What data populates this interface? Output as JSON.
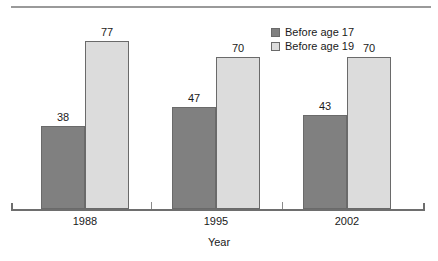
{
  "chart_data": {
    "type": "bar",
    "title": "",
    "subtitle": "",
    "xlabel": "Year",
    "ylabel": "",
    "categories": [
      "1988",
      "1995",
      "2002"
    ],
    "series": [
      {
        "name": "Before age 17",
        "values": [
          38,
          47,
          43
        ],
        "color": "#808080"
      },
      {
        "name": "Before age 19",
        "values": [
          77,
          70,
          70
        ],
        "color": "#dcdcdc"
      }
    ],
    "ylim": [
      0,
      85
    ],
    "grid": false,
    "legend_position": "top-right",
    "value_labels_shown": true,
    "annotations": []
  },
  "legend": {
    "items": [
      {
        "label": "Before age 17",
        "swatch": "dark-gray-swatch"
      },
      {
        "label": "Before age 19",
        "swatch": "light-gray-swatch"
      }
    ]
  },
  "axis": {
    "x_title": "Year",
    "tick_labels": [
      "1988",
      "1995",
      "2002"
    ]
  },
  "colors": {
    "series_1": "#808080",
    "series_2": "#dcdcdc",
    "bar_outline": "#6a6a6a",
    "axis": "#6e6e6e",
    "rule": "#9a9a9a",
    "text": "#1a1a1a"
  }
}
